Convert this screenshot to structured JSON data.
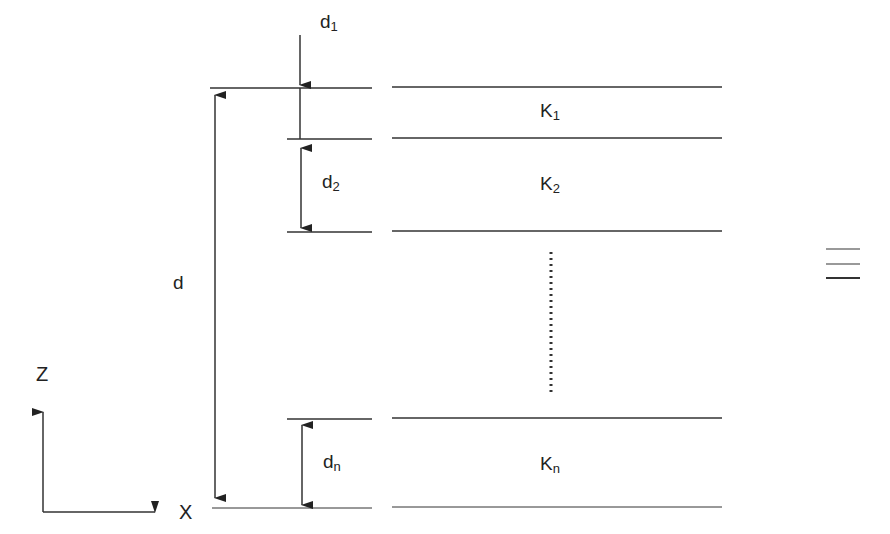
{
  "labels": {
    "d1_base": "d",
    "d1_sub": "1",
    "d2_base": "d",
    "d2_sub": "2",
    "dn_base": "d",
    "dn_sub": "n",
    "d_total": "d",
    "k1_base": "K",
    "k1_sub": "1",
    "k2_base": "K",
    "k2_sub": "2",
    "kn_base": "K",
    "kn_sub": "n",
    "axis_z": "Z",
    "axis_x": "X",
    "equiv_symbol": "≡"
  },
  "colors": {
    "line": "#333333",
    "background": "#ffffff"
  }
}
